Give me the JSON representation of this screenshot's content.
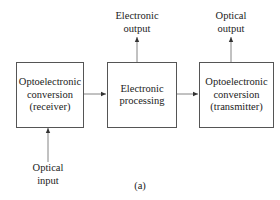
{
  "diagram": {
    "blocks": [
      {
        "id": "receiver",
        "lines": [
          "Optoelectronic",
          "conversion",
          "(receiver)"
        ]
      },
      {
        "id": "processing",
        "lines": [
          "Electronic",
          "processing"
        ]
      },
      {
        "id": "transmitter",
        "lines": [
          "Optoelectronic",
          "conversion",
          "(transmitter)"
        ]
      }
    ],
    "io_labels": {
      "electronic_output": [
        "Electronic",
        "output"
      ],
      "optical_output": [
        "Optical",
        "output"
      ],
      "optical_input": [
        "Optical",
        "input"
      ]
    },
    "caption": "(a)",
    "edges": [
      {
        "from": "optical_input",
        "to": "receiver"
      },
      {
        "from": "receiver",
        "to": "processing"
      },
      {
        "from": "processing",
        "to": "transmitter"
      },
      {
        "from": "processing",
        "to": "electronic_output"
      },
      {
        "from": "transmitter",
        "to": "optical_output"
      }
    ],
    "colors": {
      "line": "#555555",
      "text": "#222222",
      "background": "#ffffff"
    }
  }
}
